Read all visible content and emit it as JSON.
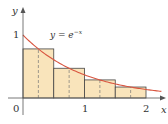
{
  "figure": {
    "type": "midpoint-riemann-sum",
    "function_label": "y = e",
    "function_exponent": "−x",
    "axis_labels": {
      "x": "x",
      "y": "y"
    },
    "tick_labels": {
      "origin": "0",
      "x1": "1",
      "x2": "2",
      "y1": "1"
    },
    "colors": {
      "fill": "#f9e4bb",
      "curve": "#d9553f",
      "outline": "#444444",
      "axis": "#555555"
    }
  },
  "chart_data": {
    "type": "bar",
    "xlabel": "x",
    "ylabel": "y",
    "xlim": [
      0,
      2
    ],
    "ylim": [
      0,
      1
    ],
    "rectangles": [
      {
        "x_left": 0.0,
        "x_right": 0.5,
        "midpoint": 0.25,
        "height": 0.779
      },
      {
        "x_left": 0.5,
        "x_right": 1.0,
        "midpoint": 0.75,
        "height": 0.472
      },
      {
        "x_left": 1.0,
        "x_right": 1.5,
        "midpoint": 1.25,
        "height": 0.287
      },
      {
        "x_left": 1.5,
        "x_right": 2.0,
        "midpoint": 1.75,
        "height": 0.174
      }
    ],
    "curve": "e^(-x)"
  }
}
